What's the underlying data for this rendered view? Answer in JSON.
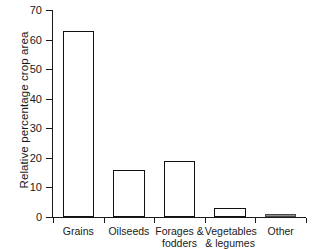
{
  "chart_data": {
    "type": "bar",
    "title": "",
    "xlabel": "",
    "ylabel": "Relative percentage crop area",
    "ylim": [
      0,
      70
    ],
    "ytick_interval": 10,
    "yticks": [
      "70",
      "60",
      "50",
      "40",
      "30",
      "20",
      "10",
      "0"
    ],
    "grid": false,
    "legend": "none",
    "categories": [
      "Grains",
      "Oilseeds",
      "Forages &\nfodders",
      "Vegetables\n& legumes",
      "Other"
    ],
    "values": [
      63,
      16,
      19,
      3,
      0.7
    ],
    "bar_style": {
      "fill": "#ffffff",
      "edge": "#111111",
      "last_bar_fill": "#8f8f8f"
    }
  },
  "axes": {
    "y_title": "Relative percentage crop area"
  }
}
